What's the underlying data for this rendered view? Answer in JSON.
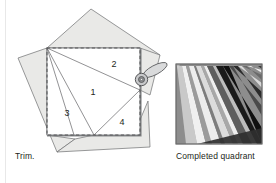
{
  "figure": {
    "captions": {
      "left": "Trim.",
      "right": "Completed quadrant"
    },
    "left_panel": {
      "name": "trim-diagram",
      "description": "Foundation-pieced square with numbered fabric wedges and a rotary cutter trimming the edge",
      "wedge_labels": [
        "1",
        "2",
        "3",
        "4"
      ],
      "wedge_positions": [
        {
          "label": "1",
          "x": 93,
          "y": 95
        },
        {
          "label": "2",
          "x": 114,
          "y": 67
        },
        {
          "label": "3",
          "x": 67,
          "y": 116
        },
        {
          "label": "4",
          "x": 122,
          "y": 125
        },
        {
          "label": "hidden",
          "x": 0,
          "y": 0
        }
      ],
      "square": {
        "x": 47,
        "y": 48,
        "width": 93,
        "height": 87
      },
      "colors": {
        "fabric_fill": "#e9e9e7",
        "fabric_stroke": "#6d6e70",
        "square_fill": "#ffffff",
        "dash_stroke": "#58595b",
        "edge_shadow": "#8a8c8e",
        "cutter_fill": "#d9dadb",
        "cutter_stroke": "#58595b",
        "cutter_hub": "#7e8083"
      }
    },
    "right_panel": {
      "name": "completed-quadrant",
      "description": "Finished quadrant block showing radiating light and dark fabric strips",
      "bounds": {
        "x": 176,
        "y": 64,
        "width": 86,
        "height": 80
      },
      "background": "#8d8d8d",
      "border": "#6e6e6e",
      "strips": [
        {
          "id": "s1",
          "color": "#c9c9c9"
        },
        {
          "id": "s2",
          "color": "#f0f0f0"
        },
        {
          "id": "s3",
          "color": "#9b9b9b"
        },
        {
          "id": "s4",
          "color": "#ededed"
        },
        {
          "id": "s5",
          "color": "#7d7d7d"
        },
        {
          "id": "s6",
          "color": "#dcdcdc"
        },
        {
          "id": "s7",
          "color": "#a8a8a8"
        },
        {
          "id": "s8",
          "color": "#efefef"
        },
        {
          "id": "s9",
          "color": "#5e5e5e"
        },
        {
          "id": "s10",
          "color": "#bdbdbd"
        },
        {
          "id": "s11",
          "color": "#1a1a1a"
        },
        {
          "id": "s12",
          "color": "#101010"
        },
        {
          "id": "s13",
          "color": "#4a4a4a"
        },
        {
          "id": "s14",
          "color": "#2b2b2b"
        },
        {
          "id": "s15",
          "color": "#d8d8d8"
        },
        {
          "id": "s16",
          "color": "#6a6a6a"
        },
        {
          "id": "s17",
          "color": "#efefef"
        },
        {
          "id": "s18",
          "color": "#3a3a3a"
        },
        {
          "id": "s19",
          "color": "#2f2f2f"
        }
      ]
    },
    "divider_color": "#e8e8e8"
  }
}
